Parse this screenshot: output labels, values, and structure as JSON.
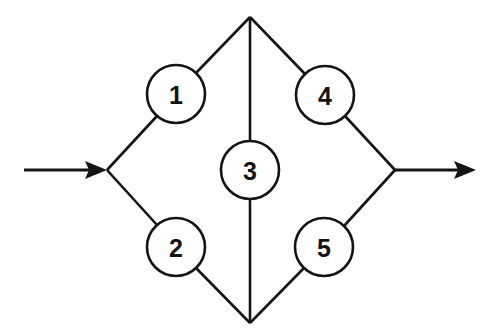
{
  "diagram": {
    "type": "reliability-block-diagram",
    "name": "bridge-network",
    "background_color": "#ffffff",
    "line_color": "#141414",
    "node_fill_color": "#ffffff",
    "canvas": {
      "width": 503,
      "height": 336
    },
    "geometry": {
      "left_vertex": {
        "x": 107,
        "y": 170
      },
      "right_vertex": {
        "x": 395,
        "y": 170
      },
      "top_vertex": {
        "x": 250,
        "y": 17
      },
      "bottom_vertex": {
        "x": 250,
        "y": 323
      },
      "node_radius": 29
    },
    "nodes": [
      {
        "id": "node-1",
        "label": "1",
        "cx": 176,
        "cy": 94,
        "r": 29
      },
      {
        "id": "node-2",
        "label": "2",
        "cx": 176,
        "cy": 247,
        "r": 29
      },
      {
        "id": "node-3",
        "label": "3",
        "cx": 250,
        "cy": 170,
        "r": 29
      },
      {
        "id": "node-4",
        "label": "4",
        "cx": 325,
        "cy": 95,
        "r": 29
      },
      {
        "id": "node-5",
        "label": "5",
        "cx": 324,
        "cy": 247,
        "r": 29
      }
    ],
    "edges": [
      {
        "id": "edge-left-to-1",
        "from": "left-vertex",
        "to": "node-1"
      },
      {
        "id": "edge-1-to-top",
        "from": "node-1",
        "to": "top-vertex"
      },
      {
        "id": "edge-left-to-2",
        "from": "left-vertex",
        "to": "node-2"
      },
      {
        "id": "edge-2-to-bottom",
        "from": "node-2",
        "to": "bottom-vertex"
      },
      {
        "id": "edge-top-to-3",
        "from": "top-vertex",
        "to": "node-3"
      },
      {
        "id": "edge-3-to-bottom",
        "from": "node-3",
        "to": "bottom-vertex"
      },
      {
        "id": "edge-top-to-4",
        "from": "top-vertex",
        "to": "node-4"
      },
      {
        "id": "edge-4-to-right",
        "from": "node-4",
        "to": "right-vertex"
      },
      {
        "id": "edge-bottom-to-5",
        "from": "bottom-vertex",
        "to": "node-5"
      },
      {
        "id": "edge-5-to-right",
        "from": "node-5",
        "to": "right-vertex"
      }
    ],
    "flows": [
      {
        "id": "input-arrow",
        "x1": 24,
        "y1": 170,
        "x2": 106,
        "y2": 170,
        "direction": "right"
      },
      {
        "id": "output-arrow",
        "x1": 395,
        "y1": 170,
        "x2": 476,
        "y2": 170,
        "direction": "right"
      }
    ]
  }
}
